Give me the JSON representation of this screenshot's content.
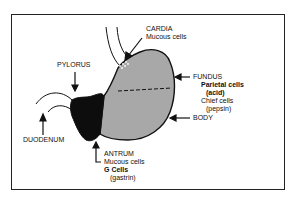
{
  "diagram": {
    "type": "anatomy",
    "colors": {
      "outline": "#111111",
      "body_fill": "#a8a8a8",
      "antrum_fill": "#0d0d0d",
      "background": "#ffffff"
    },
    "labels": {
      "cardia": {
        "title": "CARDIA",
        "lines": [
          "Mucous cells"
        ]
      },
      "pylorus": {
        "title": "PYLORUS"
      },
      "fundus": {
        "title": "FUNDUS",
        "parietal": "Parietal cells",
        "parietal_sub": "(acid)",
        "chief": "Chief cells",
        "chief_sub": "(pepsin)"
      },
      "body": {
        "title": "BODY"
      },
      "duodenum": {
        "title": "DUODENUM"
      },
      "antrum": {
        "title": "ANTRUM",
        "mucous": "Mucous cells",
        "gcells": "G Cells",
        "gcells_sub": "(gastrin)"
      }
    }
  }
}
